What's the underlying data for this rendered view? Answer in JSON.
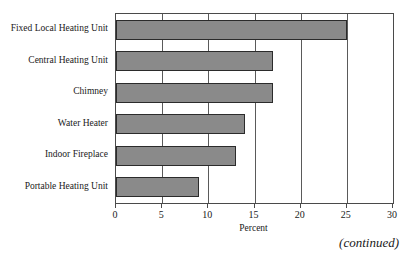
{
  "chart_data": {
    "type": "bar",
    "orientation": "horizontal",
    "title": "",
    "xlabel": "Percent",
    "ylabel": "",
    "xlim": [
      0,
      30
    ],
    "xticks": [
      0,
      5,
      10,
      15,
      20,
      25,
      30
    ],
    "xtick_labels": [
      "0",
      "5",
      "10",
      "15",
      "20",
      "25",
      "30"
    ],
    "grid": true,
    "grid_axis": "x",
    "legend": false,
    "categories": [
      "Fixed Local Heating Unit",
      "Central Heating Unit",
      "Chimney",
      "Water Heater",
      "Indoor Fireplace",
      "Portable Heating Unit"
    ],
    "values": [
      25,
      17,
      17,
      14,
      13,
      9
    ],
    "bar_color": "#8a8a8a",
    "bar_border_color": "#2b2b2b",
    "frame_color": "#4a4a4a"
  },
  "notes": {
    "continued": "(continued)"
  }
}
